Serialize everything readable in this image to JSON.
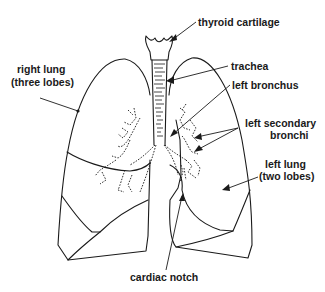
{
  "diagram": {
    "type": "anatomical-labeled-illustration",
    "labels": {
      "thyroid_cartilage": "thyroid cartilage",
      "trachea": "trachea",
      "left_bronchus": "left bronchus",
      "left_secondary_bronchi_line1": "left secondary",
      "left_secondary_bronchi_line2": "bronchi",
      "right_lung_line1": "right lung",
      "right_lung_line2": "(three lobes)",
      "left_lung_line1": "left lung",
      "left_lung_line2": "(two lobes)",
      "cardiac_notch": "cardiac notch"
    },
    "colors": {
      "ink": "#1a1a1a",
      "background": "#ffffff"
    }
  }
}
